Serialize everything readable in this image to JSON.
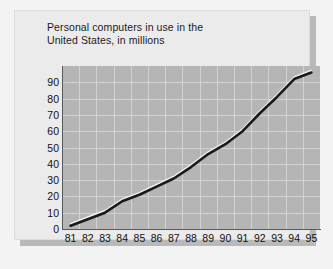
{
  "chart_data": {
    "type": "line",
    "title": "Personal computers in use in the\nUnited States, in millions",
    "xlabel": "",
    "ylabel": "",
    "categories": [
      "81",
      "82",
      "83",
      "84",
      "85",
      "86",
      "87",
      "88",
      "89",
      "90",
      "91",
      "92",
      "93",
      "94",
      "95"
    ],
    "x": [
      1981,
      1982,
      1983,
      1984,
      1985,
      1986,
      1987,
      1988,
      1989,
      1990,
      1991,
      1992,
      1993,
      1994,
      1995
    ],
    "values": [
      2,
      6,
      10,
      17,
      21,
      26,
      31,
      38,
      46,
      52,
      60,
      71,
      81,
      92,
      96
    ],
    "series": [
      {
        "name": "Personal computers in use",
        "values": [
          2,
          6,
          10,
          17,
          21,
          26,
          31,
          38,
          46,
          52,
          60,
          71,
          81,
          92,
          96
        ]
      }
    ],
    "ylim": [
      0,
      100
    ],
    "yticks": [
      0,
      10,
      20,
      30,
      40,
      50,
      60,
      70,
      80,
      90
    ],
    "ytick_labels": [
      "0",
      "10",
      "20",
      "30",
      "40",
      "50",
      "60",
      "70",
      "80",
      "90"
    ],
    "xtick_labels": [
      "81",
      "82",
      "83",
      "84",
      "85",
      "86",
      "87",
      "88",
      "89",
      "90",
      "91",
      "92",
      "93",
      "94",
      "95"
    ],
    "grid": true,
    "legend": false,
    "legend_position": "none",
    "units": "millions",
    "colors": {
      "plot_background": "#b5b5b5",
      "card_background": "#ebebeb",
      "gridline": "#d2d2d2",
      "line": "#1a1a1a",
      "line_highlight": "#f0f0f0",
      "text": "#111111"
    }
  }
}
